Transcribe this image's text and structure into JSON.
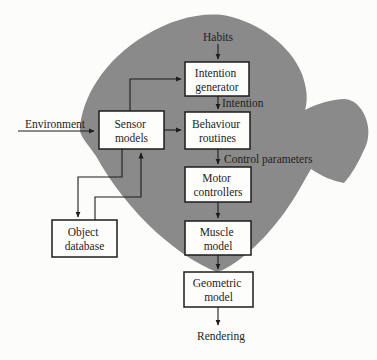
{
  "figure": {
    "background_color": "#fcfcfa",
    "fish_body_color": "#8a8a8a",
    "box_fill_color": "#fdfdfb",
    "box_border_color": "#1c1c1c",
    "line_color": "#1c1c1c",
    "text_color": "#1e1e1e"
  },
  "boxes": {
    "intention_generator": {
      "line1": "Intention",
      "line2": "generator"
    },
    "behaviour_routines": {
      "line1": "Behaviour",
      "line2": "routines"
    },
    "sensor_models": {
      "line1": "Sensor",
      "line2": "models"
    },
    "motor_controllers": {
      "line1": "Motor",
      "line2": "controllers"
    },
    "muscle_model": {
      "line1": "Muscle",
      "line2": "model"
    },
    "geometric_model": {
      "line1": "Geometric",
      "line2": "model"
    },
    "object_database": {
      "line1": "Object",
      "line2": "database"
    }
  },
  "labels": {
    "habits": "Habits",
    "intention": "Intention",
    "control_parameters": "Control parameters",
    "environment": "Environment",
    "rendering": "Rendering"
  },
  "connections": [
    {
      "from": "habits",
      "to": "intention_generator",
      "style": "arrow-down"
    },
    {
      "from": "sensor_models",
      "to": "intention_generator",
      "style": "elbow-up-right"
    },
    {
      "from": "intention_generator",
      "to": "behaviour_routines",
      "label": "Intention",
      "style": "arrow-down"
    },
    {
      "from": "environment",
      "to": "sensor_models",
      "style": "arrow-right-underline"
    },
    {
      "from": "sensor_models",
      "to": "behaviour_routines",
      "style": "arrow-right"
    },
    {
      "from": "behaviour_routines",
      "to": "motor_controllers",
      "label": "Control parameters",
      "style": "arrow-down"
    },
    {
      "from": "motor_controllers",
      "to": "muscle_model",
      "style": "arrow-down"
    },
    {
      "from": "muscle_model",
      "to": "geometric_model",
      "style": "arrow-down"
    },
    {
      "from": "geometric_model",
      "to": "rendering",
      "style": "arrow-down"
    },
    {
      "from": "sensor_models",
      "to": "object_database",
      "style": "elbow-down-left"
    },
    {
      "from": "object_database",
      "to": "sensor_models",
      "style": "elbow-up-right"
    }
  ]
}
